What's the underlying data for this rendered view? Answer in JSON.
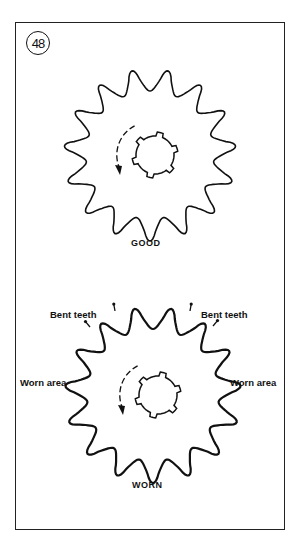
{
  "figure": {
    "number": "48",
    "panels": [
      {
        "id": "good",
        "caption": "GOOD",
        "teeth": 15,
        "center": [
          150,
          155
        ],
        "outer_radius": 86
      },
      {
        "id": "worn",
        "caption": "WORN",
        "teeth": 15,
        "center": [
          153,
          395
        ],
        "outer_radius": 88,
        "labels": {
          "bent_left": "Bent teeth",
          "bent_right": "Bent teeth",
          "worn_left": "Worn area",
          "worn_right": "Worn area"
        }
      }
    ]
  },
  "colors": {
    "line": "#111111",
    "background": "#ffffff"
  }
}
